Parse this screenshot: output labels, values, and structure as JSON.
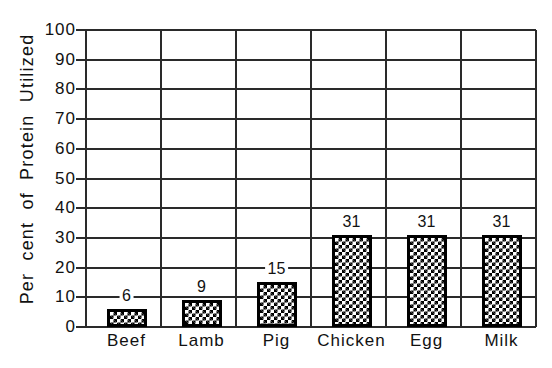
{
  "chart_data": {
    "type": "bar",
    "title": "",
    "xlabel": "",
    "ylabel": "Per cent of Protein Utilized",
    "categories": [
      "Beef",
      "Lamb",
      "Pig",
      "Chicken",
      "Egg",
      "Milk"
    ],
    "values": [
      6,
      9,
      15,
      31,
      31,
      31
    ],
    "value_labels": [
      "6",
      "9",
      "15",
      "31",
      "31",
      "31"
    ],
    "ylim": [
      0,
      100
    ],
    "yticks": [
      "0",
      "10",
      "20",
      "30",
      "40",
      "50",
      "60",
      "70",
      "80",
      "90",
      "100"
    ],
    "grid": true,
    "legend": null,
    "bar_fill": "black-and-white checkerboard",
    "colors": {
      "bar": "#000000",
      "grid": "#2a2a2a",
      "background": "#ffffff"
    }
  }
}
